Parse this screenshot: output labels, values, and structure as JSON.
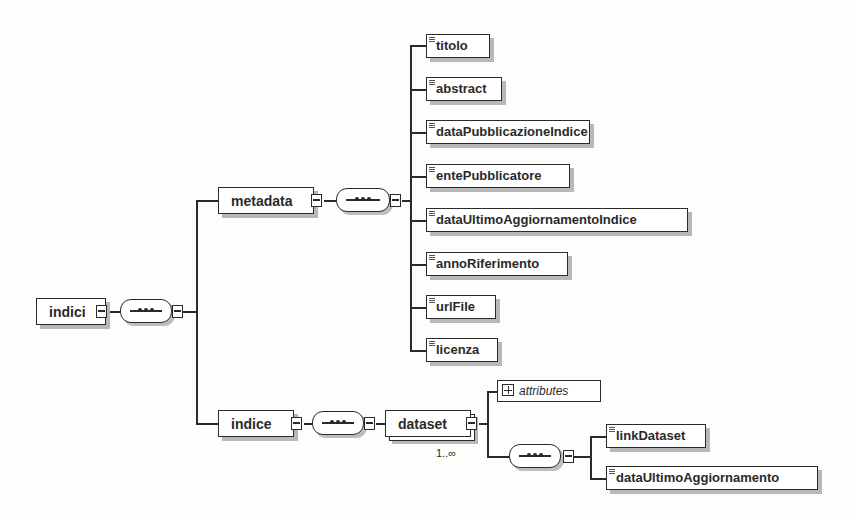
{
  "diagram": {
    "root": {
      "label": "indici"
    },
    "metadata": {
      "label": "metadata",
      "children": [
        {
          "label": "titolo"
        },
        {
          "label": "abstract"
        },
        {
          "label": "dataPubblicazioneIndice"
        },
        {
          "label": "entePubblicatore"
        },
        {
          "label": "dataUltimoAggiornamentoIndice"
        },
        {
          "label": "annoRiferimento"
        },
        {
          "label": "urlFile"
        },
        {
          "label": "licenza"
        }
      ]
    },
    "indice": {
      "label": "indice",
      "dataset": {
        "label": "dataset",
        "multiplicity": "1..∞",
        "attributes_label": "attributes",
        "children": [
          {
            "label": "linkDataset"
          },
          {
            "label": "dataUltimoAggiornamento"
          }
        ]
      }
    },
    "icons": {
      "collapse": "minus-box-icon",
      "expand": "plus-box-icon",
      "sequence": "sequence-compositor-icon",
      "simple_element": "text-lines-icon"
    }
  }
}
